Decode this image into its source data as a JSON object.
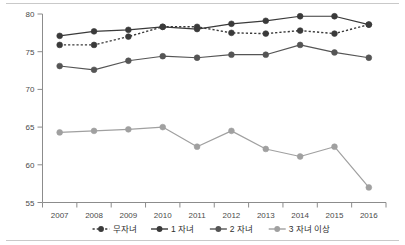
{
  "chart_data": {
    "type": "line",
    "title": "",
    "xlabel": "",
    "ylabel": "",
    "categories": [
      "2007",
      "2008",
      "2009",
      "2010",
      "2011",
      "2012",
      "2013",
      "2014",
      "2015",
      "2016"
    ],
    "x": [
      2007,
      2008,
      2009,
      2010,
      2011,
      2012,
      2013,
      2014,
      2015,
      2016
    ],
    "ylim": [
      55,
      80
    ],
    "yticks": [
      55,
      60,
      65,
      70,
      75,
      80
    ],
    "ytick_labels": [
      "55",
      "60",
      "65",
      "70",
      "75",
      "80"
    ],
    "grid": false,
    "legend_position": "bottom",
    "series": [
      {
        "name": "무자녀",
        "style": "dotted",
        "color": "#3a3a3a",
        "marker": "circle",
        "values": [
          75.9,
          75.9,
          77.0,
          78.3,
          78.3,
          77.5,
          77.4,
          77.8,
          77.4,
          78.6
        ]
      },
      {
        "name": "1 자녀",
        "style": "solid",
        "color": "#3a3a3a",
        "marker": "circle",
        "values": [
          77.1,
          77.7,
          77.9,
          78.3,
          78.0,
          78.7,
          79.1,
          79.7,
          79.7,
          78.6
        ]
      },
      {
        "name": "2 자녀",
        "style": "solid",
        "color": "#555555",
        "marker": "circle",
        "values": [
          73.1,
          72.6,
          73.8,
          74.4,
          74.2,
          74.6,
          74.6,
          75.9,
          74.9,
          74.2
        ]
      },
      {
        "name": "3 자녀 이상",
        "style": "solid",
        "color": "#a0a0a0",
        "marker": "circle",
        "values": [
          64.3,
          64.5,
          64.7,
          65.0,
          62.4,
          64.5,
          62.1,
          61.1,
          62.4,
          57.0
        ]
      }
    ]
  },
  "legend": {
    "items": [
      {
        "label": "무자녀"
      },
      {
        "label": "1 자녀"
      },
      {
        "label": "2 자녀"
      },
      {
        "label": "3 자녀 이상"
      }
    ]
  },
  "axis": {
    "y_title": "",
    "x_title": ""
  }
}
